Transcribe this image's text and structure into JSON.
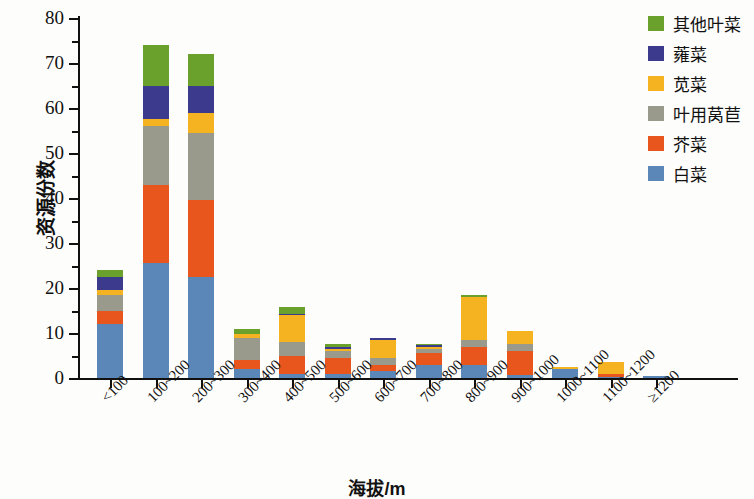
{
  "chart_data": {
    "type": "bar",
    "title": "",
    "subtitle": "",
    "stacked": true,
    "xlabel": "海拔/m",
    "ylabel": "资源份数",
    "ylim": [
      0,
      80
    ],
    "ytick_step": 10,
    "yminor_step": 5,
    "grid": false,
    "legend_position": "top-right",
    "ytick_labels": [
      "0",
      "10",
      "20",
      "30",
      "40",
      "50",
      "60",
      "70",
      "80"
    ],
    "categories": [
      "<100",
      "100~200",
      "200~300",
      "300~400",
      "400~500",
      "500~600",
      "600~700",
      "700~800",
      "800~900",
      "900~1000",
      "1000~1100",
      "1100~1200",
      "≥1200"
    ],
    "series": [
      {
        "name": "白菜",
        "color": "#5b87b8",
        "values": [
          12,
          25.5,
          22.5,
          2,
          1,
          1,
          1.5,
          3,
          3,
          0.7,
          2,
          0.3,
          0.5
        ]
      },
      {
        "name": "芥菜",
        "color": "#e8561e",
        "values": [
          3,
          17.5,
          17,
          2,
          4,
          3.5,
          1.5,
          2.5,
          4,
          5.3,
          0,
          0.7,
          0
        ]
      },
      {
        "name": "叶用莴苣",
        "color": "#9a9a8c",
        "values": [
          3.5,
          13,
          15,
          5,
          3,
          1.5,
          1.5,
          1,
          1.5,
          1.5,
          0,
          0,
          0
        ]
      },
      {
        "name": "苋菜",
        "color": "#f5b322",
        "values": [
          1,
          1.5,
          4.5,
          0.7,
          6,
          0.5,
          4,
          0.5,
          9.5,
          3,
          0.5,
          2.5,
          0
        ]
      },
      {
        "name": "蕹菜",
        "color": "#3b3a8c",
        "values": [
          3,
          7.5,
          6,
          0,
          0.3,
          0.3,
          0.3,
          0.3,
          0,
          0,
          0,
          0,
          0
        ]
      },
      {
        "name": "其他叶菜",
        "color": "#6aa02c",
        "values": [
          1.5,
          9,
          7,
          1.3,
          1.4,
          0.7,
          0,
          0.2,
          0.5,
          0,
          0,
          0,
          0
        ]
      }
    ],
    "totals": [
      24,
      74,
      72,
      11,
      15.7,
      7.5,
      8.8,
      7.5,
      18.5,
      10.5,
      2.5,
      3.5,
      0.5
    ]
  },
  "legend": {
    "items": [
      {
        "label": "其他叶菜",
        "color": "#6aa02c"
      },
      {
        "label": "蕹菜",
        "color": "#3b3a8c"
      },
      {
        "label": "苋菜",
        "color": "#f5b322"
      },
      {
        "label": "叶用莴苣",
        "color": "#9a9a8c"
      },
      {
        "label": "芥菜",
        "color": "#e8561e"
      },
      {
        "label": "白菜",
        "color": "#5b87b8"
      }
    ]
  }
}
